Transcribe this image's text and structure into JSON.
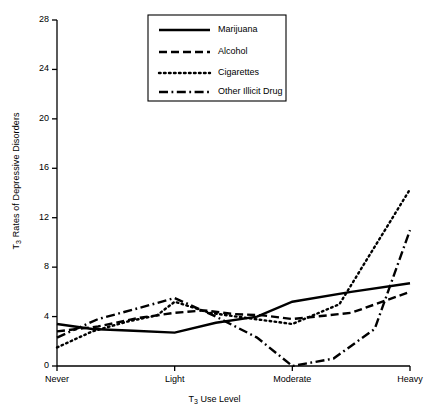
{
  "chart_data": {
    "type": "line",
    "title": "",
    "xlabel": "T3 Use Level",
    "ylabel": "T3 Rates of Depressive Disorders",
    "categories": [
      "Never",
      "Light",
      "Moderate",
      "Heavy"
    ],
    "x": [
      0,
      1,
      2,
      3
    ],
    "ylim": [
      0,
      28
    ],
    "yticks": [
      0,
      4,
      8,
      12,
      16,
      20,
      24,
      28
    ],
    "grid": false,
    "legend_position": "top-center",
    "series": [
      {
        "name": "Marijuana",
        "style": "solid",
        "values": [
          3.4,
          2.7,
          5.2,
          6.7
        ],
        "detailed_x": [
          0,
          0.3,
          0.65,
          1.0,
          1.35,
          1.7,
          2.0,
          2.5,
          3.0
        ],
        "detailed_values": [
          3.4,
          3.0,
          2.85,
          2.7,
          3.5,
          4.0,
          5.2,
          6.0,
          6.7
        ]
      },
      {
        "name": "Alcohol",
        "style": "dashed",
        "values": [
          2.8,
          4.3,
          3.8,
          6.0
        ],
        "detailed_x": [
          0,
          0.35,
          0.7,
          1.0,
          1.25,
          1.5,
          1.75,
          2.0,
          2.5,
          3.0
        ],
        "detailed_values": [
          2.8,
          3.2,
          3.9,
          4.3,
          4.5,
          4.2,
          4.1,
          3.8,
          4.3,
          6.0
        ]
      },
      {
        "name": "Cigarettes",
        "style": "dotted",
        "values": [
          1.5,
          5.2,
          3.4,
          14.3
        ],
        "detailed_x": [
          0,
          0.3,
          0.6,
          0.85,
          1.0,
          1.3,
          1.6,
          2.0,
          2.4,
          3.0
        ],
        "detailed_values": [
          1.5,
          2.8,
          3.6,
          4.1,
          5.2,
          4.3,
          3.9,
          3.4,
          5.0,
          14.3
        ]
      },
      {
        "name": "Other Illicit Drug",
        "style": "dashdot",
        "values": [
          2.3,
          5.5,
          0.0,
          11.0
        ],
        "detailed_x": [
          0,
          0.35,
          0.7,
          1.0,
          1.35,
          1.7,
          2.0,
          2.35,
          2.7,
          3.0
        ],
        "detailed_values": [
          2.3,
          3.8,
          4.7,
          5.5,
          4.0,
          2.3,
          0.0,
          0.6,
          3.0,
          11.0
        ]
      }
    ]
  },
  "axes": {
    "y_title_prefix": "T",
    "y_title_sub": "3",
    "y_title_rest": " Rates of Depressive Disorders",
    "x_title_prefix": "T",
    "x_title_sub": "3",
    "x_title_rest": " Use Level",
    "ytick_labels": [
      "0",
      "4",
      "8",
      "12",
      "16",
      "20",
      "24",
      "28"
    ],
    "xtick_labels": [
      "Never",
      "Light",
      "Moderate",
      "Heavy"
    ]
  },
  "legend": {
    "items": [
      {
        "label": "Marijuana"
      },
      {
        "label": "Alcohol"
      },
      {
        "label": "Cigarettes"
      },
      {
        "label": "Other Illicit Drug"
      }
    ]
  },
  "style": {
    "line_color": "#000000",
    "axis_color": "#000000",
    "background": "#ffffff"
  }
}
